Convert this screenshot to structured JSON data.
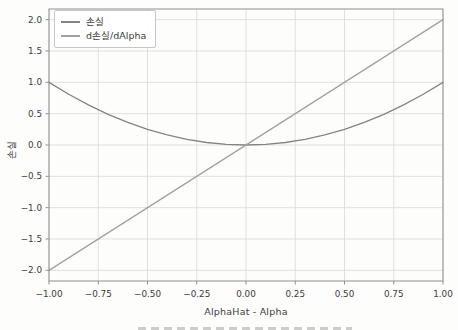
{
  "figure": {
    "background": "#fdfdfc",
    "axes_color": "#8f8f8f",
    "grid_color": "#dcdcdc",
    "tick_text_color": "#3c3c3c"
  },
  "legend": {
    "position": "upper-left",
    "items": [
      {
        "label": "손실",
        "color": "#848484"
      },
      {
        "label": "d손실/dAlpha",
        "color": "#a2a2a2"
      }
    ]
  },
  "chart_data": {
    "type": "line",
    "title": "",
    "xlabel": "AlphaHat - Alpha",
    "ylabel": "손실",
    "xlim": [
      -1.0,
      1.0
    ],
    "ylim": [
      -2.17,
      2.17
    ],
    "grid": true,
    "legend_position": "upper left",
    "x_ticks": {
      "values": [
        -1.0,
        -0.75,
        -0.5,
        -0.25,
        0.0,
        0.25,
        0.5,
        0.75,
        1.0
      ],
      "labels": [
        "−1.00",
        "−0.75",
        "−0.50",
        "−0.25",
        "0.00",
        "0.25",
        "0.50",
        "0.75",
        "1.00"
      ]
    },
    "y_ticks": {
      "values": [
        2.0,
        1.5,
        1.0,
        0.5,
        0.0,
        -0.5,
        -1.0,
        -1.5,
        -2.0
      ],
      "labels": [
        "2.0",
        "1.5",
        "1.0",
        "0.5",
        "0.0",
        "−0.5",
        "−1.0",
        "−1.5",
        "−2.0"
      ]
    },
    "series": [
      {
        "name": "손실",
        "color": "#848484",
        "line_width": 1.3,
        "x": [
          -1.0,
          -0.9,
          -0.8,
          -0.7,
          -0.6,
          -0.5,
          -0.4,
          -0.3,
          -0.2,
          -0.1,
          0.0,
          0.1,
          0.2,
          0.3,
          0.4,
          0.5,
          0.6,
          0.7,
          0.8,
          0.9,
          1.0
        ],
        "y": [
          1.0,
          0.81,
          0.64,
          0.49,
          0.36,
          0.25,
          0.16,
          0.09,
          0.04,
          0.01,
          0.0,
          0.01,
          0.04,
          0.09,
          0.16,
          0.25,
          0.36,
          0.49,
          0.64,
          0.81,
          1.0
        ]
      },
      {
        "name": "d손실/dAlpha",
        "color": "#a2a2a2",
        "line_width": 1.3,
        "x": [
          -1.0,
          1.0
        ],
        "y": [
          -2.0,
          2.0
        ]
      }
    ]
  }
}
